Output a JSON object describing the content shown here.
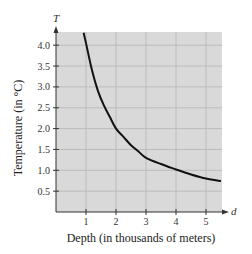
{
  "chart_data": {
    "type": "line",
    "title": "",
    "xlabel": "Depth (in thousands of meters)",
    "ylabel": "Temperature (in °C)",
    "x_axis_variable": "d",
    "y_axis_variable": "T",
    "xlim": [
      0,
      5.5
    ],
    "ylim": [
      0,
      4.3
    ],
    "x_ticks": [
      1,
      2,
      3,
      4,
      5
    ],
    "x_tick_labels": [
      "1",
      "2",
      "3",
      "4",
      "5"
    ],
    "y_ticks": [
      0.5,
      1.0,
      1.5,
      2.0,
      2.5,
      3.0,
      3.5,
      4.0
    ],
    "y_tick_labels": [
      "0.5",
      "1.0",
      "1.5",
      "2.0",
      "2.5",
      "3.0",
      "3.5",
      "4.0"
    ],
    "grid": true,
    "legend": null,
    "series": [
      {
        "name": "T",
        "x": [
          0.92,
          1.0,
          1.2,
          1.4,
          1.6,
          1.8,
          2.0,
          2.25,
          2.5,
          2.75,
          3.0,
          3.5,
          4.0,
          4.5,
          5.0,
          5.5
        ],
        "values": [
          4.3,
          4.05,
          3.4,
          2.9,
          2.55,
          2.27,
          2.0,
          1.8,
          1.6,
          1.45,
          1.3,
          1.15,
          1.02,
          0.9,
          0.8,
          0.74
        ]
      }
    ]
  },
  "colors": {
    "plot_background": "#d9d9d9",
    "grid": "#bcbcbc",
    "curve": "#111111",
    "axis": "#333333"
  }
}
